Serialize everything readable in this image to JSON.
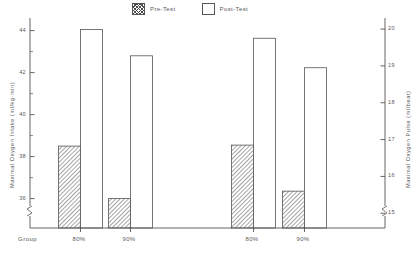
{
  "legend": {
    "entries": [
      {
        "label": "Pre-Test",
        "style": "hatched"
      },
      {
        "label": "Post-Test",
        "style": "open"
      }
    ]
  },
  "axes": {
    "left_title": "Maximal Oxygen Intake (ml/kg·min)",
    "right_title": "Maximal Oxygen Pulse (ml/beat)",
    "x_corner_label": "Group",
    "left_ticks": [
      "44",
      "42",
      "40",
      "38",
      "36"
    ],
    "right_ticks": [
      "20",
      "19",
      "18",
      "17",
      "16",
      "15"
    ],
    "x_ticks": [
      "80%",
      "90%",
      "80%",
      "90%"
    ]
  },
  "chart_data": {
    "type": "bar",
    "title": "",
    "xlabel": "Group",
    "ylabel": "Maximal Oxygen Intake (ml/kg·min)",
    "y2label": "Maximal Oxygen Pulse (ml/beat)",
    "categories": [
      "80%",
      "90%",
      "80%",
      "90%"
    ],
    "category_panels": [
      {
        "panel": "Maximal Oxygen Intake (ml/kg·min)",
        "categories": [
          "80%",
          "90%"
        ],
        "axis": "left"
      },
      {
        "panel": "Maximal Oxygen Pulse (ml/beat)",
        "categories": [
          "80%",
          "90%"
        ],
        "axis": "right"
      }
    ],
    "series": [
      {
        "name": "Pre-Test",
        "values": [
          38.5,
          36.0,
          16.85,
          15.6
        ]
      },
      {
        "name": "Post-Test",
        "values": [
          44.05,
          42.8,
          19.75,
          18.95
        ]
      }
    ],
    "series_left_axis_units": [
      {
        "name": "Pre-Test",
        "values": [
          38.5,
          36.0
        ]
      },
      {
        "name": "Post-Test",
        "values": [
          44.05,
          42.8
        ]
      }
    ],
    "series_right_axis_units": [
      {
        "name": "Pre-Test",
        "values": [
          16.85,
          15.6
        ]
      },
      {
        "name": "Post-Test",
        "values": [
          19.75,
          18.95
        ]
      }
    ],
    "ylim": [
      34.6,
      44.6
    ],
    "y2lim": [
      14.6,
      20.3
    ],
    "ytick_values": [
      44,
      42,
      40,
      38,
      36
    ],
    "y2tick_values": [
      20,
      19,
      18,
      17,
      16,
      15
    ],
    "minor_ticks": true,
    "grid": false,
    "axis_break": true,
    "legend_position": "top-center",
    "bar_fill_pre": "#ffffff",
    "bar_fill_post": "#ffffff",
    "bar_edge_color": "#555555",
    "hatch_pre": "diagonal"
  }
}
